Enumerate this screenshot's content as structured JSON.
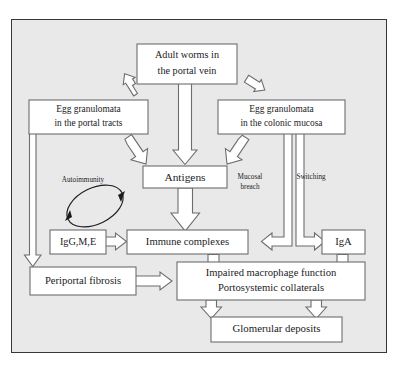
{
  "figure": {
    "title": "",
    "background_color": "#e9e9e9",
    "frame_border_color": "#38383a",
    "box_fill": "#ffffff",
    "box_stroke": "#6d6d70",
    "text_color": "#1b1b1d"
  },
  "nodes": {
    "adult_worms": {
      "line1": "Adult worms in",
      "line2": "the portal vein"
    },
    "egg_portal": {
      "line1": "Egg granulomata",
      "line2": "in the portal tracts"
    },
    "egg_colonic": {
      "line1": "Egg granulomata",
      "line2": "in the colonic mucosa"
    },
    "antigens": {
      "line1": "Antigens"
    },
    "ig_gme": {
      "line1": "IgG,M,E"
    },
    "immune_complexes": {
      "line1": "Immune complexes"
    },
    "iga": {
      "line1": "IgA"
    },
    "periportal_fibrosis": {
      "line1": "Periportal fibrosis"
    },
    "impaired": {
      "line1": "Impaired macrophage function",
      "line2": "Portosystemic collaterals"
    },
    "glomerular": {
      "line1": "Glomerular deposits"
    }
  },
  "edge_labels": {
    "autoimmunity": "Autoimmunity",
    "mucosal_breach_line1": "Mucosal",
    "mucosal_breach_line2": "breach",
    "switching": "Switching"
  },
  "edges": [
    {
      "from": "adult_worms",
      "to": "egg_portal",
      "style": "block-arrow"
    },
    {
      "from": "adult_worms",
      "to": "egg_colonic",
      "style": "block-arrow"
    },
    {
      "from": "adult_worms",
      "to": "antigens",
      "style": "block-arrow"
    },
    {
      "from": "egg_portal",
      "to": "antigens",
      "style": "block-arrow"
    },
    {
      "from": "egg_colonic",
      "to": "antigens",
      "style": "block-arrow"
    },
    {
      "from": "egg_portal",
      "to": "periportal_fibrosis",
      "style": "block-arrow"
    },
    {
      "from": "antigens",
      "to": "immune_complexes",
      "style": "block-arrow"
    },
    {
      "from": "ig_gme",
      "to": "immune_complexes",
      "style": "block-arrow"
    },
    {
      "from": "egg_colonic",
      "to": "immune_complexes",
      "style": "block-arrow",
      "label": "mucosal_breach"
    },
    {
      "from": "egg_colonic",
      "to": "iga",
      "style": "block-arrow",
      "label": "switching"
    },
    {
      "from": "periportal_fibrosis",
      "to": "impaired",
      "style": "block-arrow"
    },
    {
      "from": "immune_complexes",
      "to": "impaired",
      "style": "connector"
    },
    {
      "from": "iga",
      "to": "impaired",
      "style": "connector"
    },
    {
      "from": "impaired",
      "to": "glomerular",
      "style": "block-arrow"
    },
    {
      "from": "ig_gme",
      "to": "ig_gme",
      "style": "loop",
      "label": "autoimmunity"
    }
  ]
}
